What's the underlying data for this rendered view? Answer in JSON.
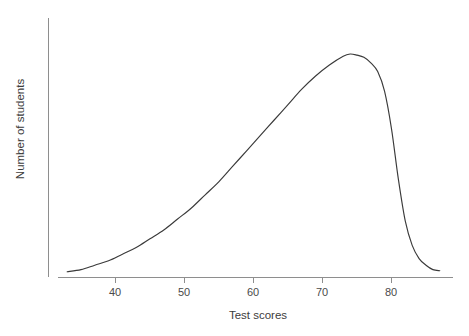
{
  "chart_data": {
    "type": "line",
    "title": "",
    "subtitle": "",
    "xlabel": "Test scores",
    "ylabel": "Number of students",
    "xlim": [
      33,
      88
    ],
    "ylim": [
      0,
      1.05
    ],
    "grid": false,
    "legend": null,
    "axis_style": "open (left spine and bottom spine only, no y tick labels)",
    "xticks": [
      40,
      50,
      60,
      70,
      80
    ],
    "xticklabels": [
      "40",
      "50",
      "60",
      "70",
      "80"
    ],
    "yticks": [],
    "yticklabels": [],
    "annotations": [],
    "series": [
      {
        "name": "Number of students",
        "color": "#3a3a3a",
        "description": "Smooth left-skewed (negatively skewed) unimodal density of test scores: very low near 33, slow steady rise through the 40s and 50s, steeper climb through the 60s, rounded maximum near a score of 74, a brief plateau to about 78, then a sharp drop between 79 and 83, flattening out to nearly zero by 86.",
        "x": [
          33,
          35,
          37,
          39,
          41,
          43,
          45,
          47,
          49,
          51,
          53,
          55,
          57,
          59,
          61,
          63,
          65,
          67,
          69,
          71,
          73,
          74,
          75,
          76,
          77,
          78,
          79,
          80,
          81,
          82,
          83,
          84,
          85,
          86,
          87
        ],
        "y": [
          0.01,
          0.02,
          0.04,
          0.06,
          0.09,
          0.12,
          0.16,
          0.2,
          0.25,
          0.3,
          0.36,
          0.42,
          0.49,
          0.56,
          0.63,
          0.7,
          0.77,
          0.84,
          0.9,
          0.95,
          0.99,
          1.0,
          0.995,
          0.985,
          0.96,
          0.92,
          0.83,
          0.66,
          0.43,
          0.24,
          0.13,
          0.07,
          0.04,
          0.02,
          0.015
        ],
        "peak_x": 74,
        "peak_y": 1.0
      }
    ]
  },
  "labels": {
    "x_axis_title": "Test scores",
    "y_axis_title": "Number of students"
  },
  "colors": {
    "curve": "#3a3a3a",
    "axis": "#8e8e8e",
    "text": "#3c3c3c",
    "background": "#ffffff"
  }
}
